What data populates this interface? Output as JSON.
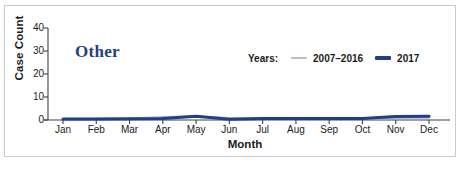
{
  "figure": {
    "panel_title": "Other",
    "border_color": "#c9cbd2",
    "background": "#ffffff",
    "title_color": "#22417e"
  },
  "legend": {
    "title": "Years:",
    "position": "top-right-inside",
    "entries": [
      {
        "label": "2007–2016",
        "color": "#b9bbd0",
        "icon": "line-swatch-thin"
      },
      {
        "label": "2017",
        "color": "#1f3f86",
        "icon": "line-swatch-thick"
      }
    ]
  },
  "axes": {
    "x_title": "Month",
    "y_title": "Case Count",
    "y_ticks": [
      "40",
      "30",
      "20",
      "10",
      "0"
    ],
    "x_ticks": [
      "Jan",
      "Feb",
      "Mar",
      "Apr",
      "May",
      "Jun",
      "Jul",
      "Aug",
      "Sep",
      "Oct",
      "Nov",
      "Dec"
    ]
  },
  "chart_data": {
    "type": "line",
    "title": "Other",
    "xlabel": "Month",
    "ylabel": "Case Count",
    "categories": [
      "Jan",
      "Feb",
      "Mar",
      "Apr",
      "May",
      "Jun",
      "Jul",
      "Aug",
      "Sep",
      "Oct",
      "Nov",
      "Dec"
    ],
    "ylim": [
      0,
      40
    ],
    "yticks": [
      0,
      10,
      20,
      30,
      40
    ],
    "grid": false,
    "legend": "inside-top-right",
    "series": [
      {
        "name": "2007–2016",
        "color": "#b9bbd0",
        "values": [
          0.4,
          0.5,
          0.6,
          1.3,
          1.6,
          0.9,
          0.8,
          0.7,
          0.6,
          0.6,
          0.9,
          1.0
        ]
      },
      {
        "name": "2017",
        "color": "#1f3f86",
        "values": [
          0.4,
          0.4,
          0.5,
          0.7,
          1.6,
          0.3,
          0.7,
          0.7,
          0.6,
          0.6,
          1.5,
          1.6
        ]
      }
    ]
  }
}
